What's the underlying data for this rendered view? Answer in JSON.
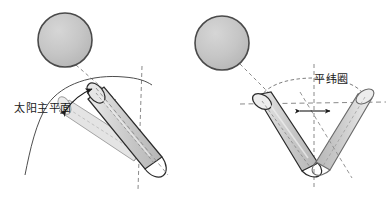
{
  "figure": {
    "title_visible": false,
    "background_color": "#ffffff",
    "width": 392,
    "height": 200,
    "panels": [
      {
        "id": "left-panel",
        "name": "solar-principal-plane-panel",
        "label": "太阳主平面",
        "label_position": {
          "x": 14,
          "y": 112
        },
        "sphere": {
          "cx": 65,
          "cy": 40,
          "r": 27
        },
        "description_elements": [
          "sphere",
          "dashed-sight-line",
          "ghost-cylinder",
          "main-cylinder",
          "vertical-dashed-axis",
          "curved-arc",
          "double-headed-curved-arrow"
        ]
      },
      {
        "id": "right-panel",
        "name": "parallel-latitude-circle-panel",
        "label": "平纬圈",
        "label_position": {
          "x": 314,
          "y": 83
        },
        "sphere": {
          "cx": 222,
          "cy": 43,
          "r": 27
        },
        "description_elements": [
          "sphere",
          "dashed-sight-line",
          "left-cylinder",
          "right-cylinder",
          "horizontal-dashed-line",
          "vertical-dashed-axis",
          "ellipse-arc",
          "double-headed-arrow"
        ]
      }
    ]
  },
  "colors": {
    "sphere_fill": "#c3c3c3",
    "sphere_stroke": "#4a4a4a",
    "cylinder_fill_light": "#d9d9d9",
    "cylinder_fill_mid": "#c9c9c9",
    "cylinder_ghost_fill": "#e2e2e2",
    "outline": "#2b2b2b",
    "ghost_outline": "#8f8f8f",
    "dashed": "#8a8a8a",
    "text": "#1b1b1b",
    "background": "#ffffff"
  },
  "labels": {
    "left": "太阳主平面",
    "right": "平纬圈"
  }
}
